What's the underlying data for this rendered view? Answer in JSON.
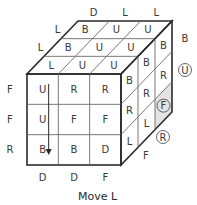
{
  "caption": "Move L",
  "colors": {
    "line": "#2b2b2b",
    "grid": "#6a6a6a",
    "shade": "#e3e3e3",
    "text": "#3a3a3a"
  },
  "cube": {
    "front": [
      [
        "U",
        "R",
        "R"
      ],
      [
        "U",
        "F",
        "F"
      ],
      [
        "B",
        "B",
        "D"
      ]
    ],
    "top": [
      [
        "B",
        "U",
        "U"
      ],
      [
        "B",
        "U",
        "U"
      ],
      [
        "L",
        "U",
        "U"
      ]
    ],
    "right": [
      [
        "B",
        "B",
        "B"
      ],
      [
        "R",
        "R",
        "R"
      ],
      [
        "L",
        "L",
        "F"
      ]
    ],
    "right_shaded_cell": {
      "row": 2,
      "col": 2,
      "circled": true
    }
  },
  "outer_labels": {
    "front_left": [
      "F",
      "F",
      "R"
    ],
    "front_bottom": [
      "D",
      "D",
      "F"
    ],
    "top_back": [
      "D",
      "L",
      "L"
    ],
    "top_left": [
      "L",
      "L"
    ],
    "right_back": [
      "B"
    ],
    "right_circled": [
      "U",
      "R"
    ]
  },
  "arrow": {
    "direction": "down",
    "column": 0,
    "meaning": "L move"
  }
}
